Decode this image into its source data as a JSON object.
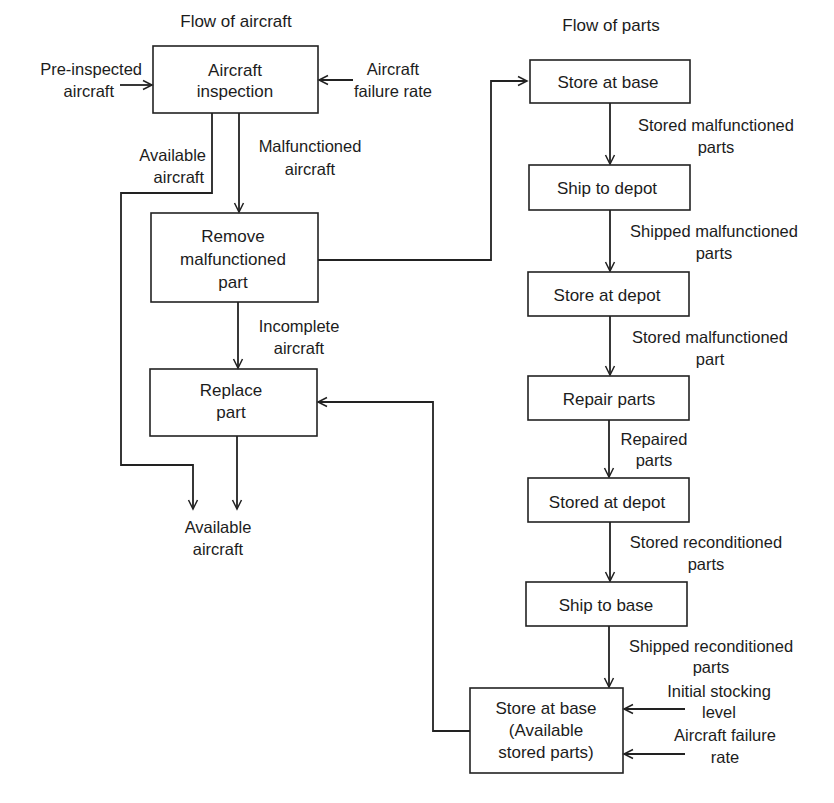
{
  "columns": {
    "aircraft_title": "Flow of aircraft",
    "parts_title": "Flow of parts"
  },
  "aircraft_flow": {
    "boxes": [
      {
        "id": "aircraft-inspection",
        "lines": [
          "Aircraft",
          "inspection"
        ]
      },
      {
        "id": "remove-malfunctioned-part",
        "lines": [
          "Remove",
          "malfunctioned",
          "part"
        ]
      },
      {
        "id": "replace-part",
        "lines": [
          "Replace",
          "part"
        ]
      }
    ],
    "inputs": {
      "pre_inspected": [
        "Pre-inspected",
        "aircraft"
      ],
      "failure_rate": [
        "Aircraft",
        "failure rate"
      ]
    },
    "edge_labels": {
      "available": [
        "Available",
        "aircraft"
      ],
      "malfunctioned": [
        "Malfunctioned",
        "aircraft"
      ],
      "incomplete": [
        "Incomplete",
        "aircraft"
      ]
    },
    "output": [
      "Available",
      "aircraft"
    ]
  },
  "parts_flow": {
    "boxes": [
      {
        "id": "store-at-base",
        "lines": [
          "Store at base"
        ]
      },
      {
        "id": "ship-to-depot",
        "lines": [
          "Ship to depot"
        ]
      },
      {
        "id": "store-at-depot",
        "lines": [
          "Store at depot"
        ]
      },
      {
        "id": "repair-parts",
        "lines": [
          "Repair parts"
        ]
      },
      {
        "id": "stored-at-depot",
        "lines": [
          "Stored at depot"
        ]
      },
      {
        "id": "ship-to-base",
        "lines": [
          "Ship to base"
        ]
      },
      {
        "id": "store-at-base-available",
        "lines": [
          "Store at base",
          "(Available",
          "stored parts)"
        ]
      }
    ],
    "edge_labels": [
      [
        "Stored malfunctioned",
        "parts"
      ],
      [
        "Shipped malfunctioned",
        "parts"
      ],
      [
        "Stored malfunctioned",
        "part"
      ],
      [
        "Repaired",
        "parts"
      ],
      [
        "Stored reconditioned",
        "parts"
      ],
      [
        "Shipped reconditioned",
        "parts"
      ]
    ],
    "inputs": {
      "initial_stocking": [
        "Initial stocking",
        "level"
      ],
      "failure_rate": [
        "Aircraft failure",
        "rate"
      ]
    }
  }
}
